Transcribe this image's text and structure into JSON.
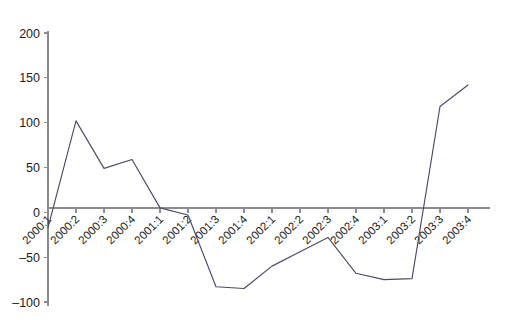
{
  "chart_data": {
    "type": "line",
    "title": "",
    "subtitle": "",
    "xlabel": "",
    "ylabel": "",
    "grid": false,
    "legend": false,
    "legend_position": "none",
    "line_color": "#4a4a66",
    "axis_color": "#8c8c8c",
    "background_color": "#ffffff",
    "ylim": [
      -100,
      200
    ],
    "ytick_labels": [
      "200",
      "150",
      "100",
      "50",
      "0",
      "–50",
      "–100"
    ],
    "ytick_values": [
      200,
      150,
      100,
      50,
      0,
      -50,
      -100
    ],
    "categories": [
      "2000:1",
      "2000:2",
      "2000:3",
      "2000:4",
      "2001:1",
      "2001:2",
      "2001:3",
      "2001:4",
      "2002:1",
      "2002:2",
      "2002:3",
      "2002:4",
      "2003:1",
      "2003:2",
      "2003:3",
      "2003:4"
    ],
    "series": [
      {
        "name": "series-1",
        "values": [
          -17,
          102,
          49,
          59,
          5,
          -3,
          -83,
          -85,
          -60,
          -44,
          -28,
          -68,
          -75,
          -74,
          118,
          142
        ]
      }
    ]
  }
}
